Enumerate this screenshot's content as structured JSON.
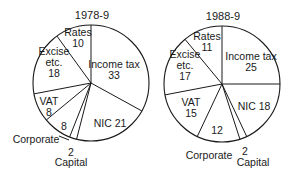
{
  "chart_data": [
    {
      "type": "pie",
      "title": "1978-9",
      "start_angle_deg": 0,
      "direction": "clockwise",
      "categories": [
        "Income tax",
        "NIC",
        "Capital",
        "Corporate",
        "VAT",
        "Excise etc.",
        "Rates"
      ],
      "values": [
        33,
        21,
        2,
        8,
        8,
        18,
        10
      ],
      "center": [
        91,
        83
      ],
      "radius": 58,
      "labels": [
        {
          "lines": [
            "Income tax",
            "33"
          ],
          "x": 114,
          "y": 69
        },
        {
          "lines": [
            "NIC 21"
          ],
          "x": 110,
          "y": 123
        },
        {
          "lines": [
            "2"
          ],
          "x": 71,
          "y": 152,
          "outside": true
        },
        {
          "lines": [
            "Capital"
          ],
          "x": 71,
          "y": 162,
          "outside": true
        },
        {
          "lines": [
            "8"
          ],
          "x": 64,
          "y": 126
        },
        {
          "lines": [
            "VAT",
            "8"
          ],
          "x": 49,
          "y": 106
        },
        {
          "lines": [
            "Excise",
            "etc.",
            "18"
          ],
          "x": 54,
          "y": 62
        },
        {
          "lines": [
            "Rates",
            "10"
          ],
          "x": 78,
          "y": 37
        },
        {
          "lines": [
            "Corporate"
          ],
          "x": 36,
          "y": 139,
          "outside": true
        }
      ],
      "leader_lines": [
        [
          [
            59,
            136
          ],
          [
            69,
            140
          ]
        ]
      ]
    },
    {
      "type": "pie",
      "title": "1988-9",
      "start_angle_deg": 0,
      "direction": "clockwise",
      "categories": [
        "Income tax",
        "NIC",
        "Capital",
        "Corporate",
        "VAT",
        "Excise etc.",
        "Rates"
      ],
      "values": [
        25,
        18,
        2,
        12,
        15,
        17,
        11
      ],
      "center": [
        222,
        84
      ],
      "radius": 58,
      "labels": [
        {
          "lines": [
            "Income tax",
            "25"
          ],
          "x": 251,
          "y": 61
        },
        {
          "lines": [
            "NIC 18"
          ],
          "x": 254,
          "y": 106
        },
        {
          "lines": [
            "2"
          ],
          "x": 245,
          "y": 151,
          "outside": true
        },
        {
          "lines": [
            "Capital"
          ],
          "x": 253,
          "y": 162,
          "outside": true
        },
        {
          "lines": [
            "12"
          ],
          "x": 217,
          "y": 130
        },
        {
          "lines": [
            "VAT",
            "15"
          ],
          "x": 191,
          "y": 107
        },
        {
          "lines": [
            "Excise",
            "etc.",
            "17"
          ],
          "x": 185,
          "y": 65
        },
        {
          "lines": [
            "Rates",
            "11"
          ],
          "x": 207,
          "y": 41
        },
        {
          "lines": [
            "Corporate"
          ],
          "x": 209,
          "y": 155,
          "outside": true
        }
      ],
      "leader_lines": []
    }
  ],
  "colors": {
    "fill": "#ffffff",
    "stroke": "#1a1a1a"
  }
}
